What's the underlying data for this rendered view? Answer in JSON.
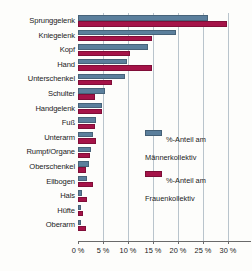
{
  "chart_data": {
    "type": "bar",
    "orientation": "horizontal",
    "title": "",
    "xlabel": "",
    "ylabel": "",
    "xlim": [
      0,
      31
    ],
    "grid": true,
    "grid_axis": "x",
    "legend_position": "center-right",
    "xticks": [
      0,
      5,
      10,
      15,
      20,
      25,
      30
    ],
    "xtick_labels": [
      "0 %",
      "5 %",
      "10 %",
      "15 %",
      "20 %",
      "25 %",
      "30 %"
    ],
    "categories": [
      "Sprunggelenk",
      "Kniegelenk",
      "Kopf",
      "Hand",
      "Unterschenkel",
      "Schulter",
      "Handgelenk",
      "Fuß",
      "Unterarm",
      "Rumpf/Organe",
      "Oberschenkel",
      "Ellbogen",
      "Hals",
      "Hüfte",
      "Oberarm"
    ],
    "series": [
      {
        "name": "%-Anteil am Männerkollektiv",
        "color": "#5b7f9c",
        "values": [
          26.0,
          19.5,
          14.0,
          9.7,
          9.4,
          5.4,
          4.8,
          3.6,
          2.9,
          2.6,
          2.2,
          1.8,
          0.7,
          0.5,
          0.6
        ]
      },
      {
        "name": "%-Anteil am Frauenkollektiv",
        "color": "#a51348",
        "values": [
          29.8,
          14.8,
          10.4,
          14.8,
          6.8,
          3.3,
          4.8,
          3.4,
          3.6,
          2.3,
          1.6,
          3.0,
          1.8,
          1.0,
          1.6
        ]
      }
    ]
  },
  "legend": {
    "items": [
      {
        "label": "%-Anteil am\nMännerkollektiv",
        "color": "#5b7f9c",
        "swatch_name": "legend-swatch-maenner"
      },
      {
        "label": "%-Anteil am\nFrauenkollektiv",
        "color": "#a51348",
        "swatch_name": "legend-swatch-frauen"
      }
    ]
  }
}
